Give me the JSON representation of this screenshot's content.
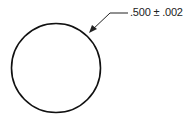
{
  "diagram": {
    "type": "engineering-dimension",
    "shape": "circle",
    "dimension_label": ".500 ± .002",
    "colors": {
      "stroke": "#111111",
      "background": "#ffffff"
    }
  }
}
